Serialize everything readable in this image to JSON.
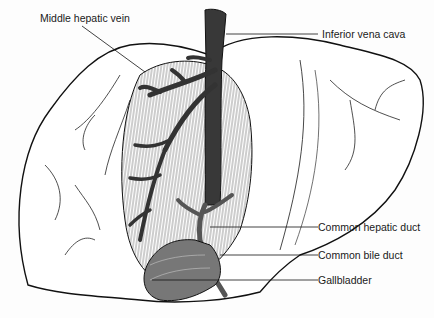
{
  "figure": {
    "labels": [
      {
        "id": "middle-hepatic-vein",
        "text": "Middle hepatic vein"
      },
      {
        "id": "inferior-vena-cava",
        "text": "Inferior vena cava"
      },
      {
        "id": "common-hepatic-duct",
        "text": "Common hepatic duct"
      },
      {
        "id": "common-bile-duct",
        "text": "Common bile duct"
      },
      {
        "id": "gallbladder",
        "text": "Gallbladder"
      }
    ]
  }
}
